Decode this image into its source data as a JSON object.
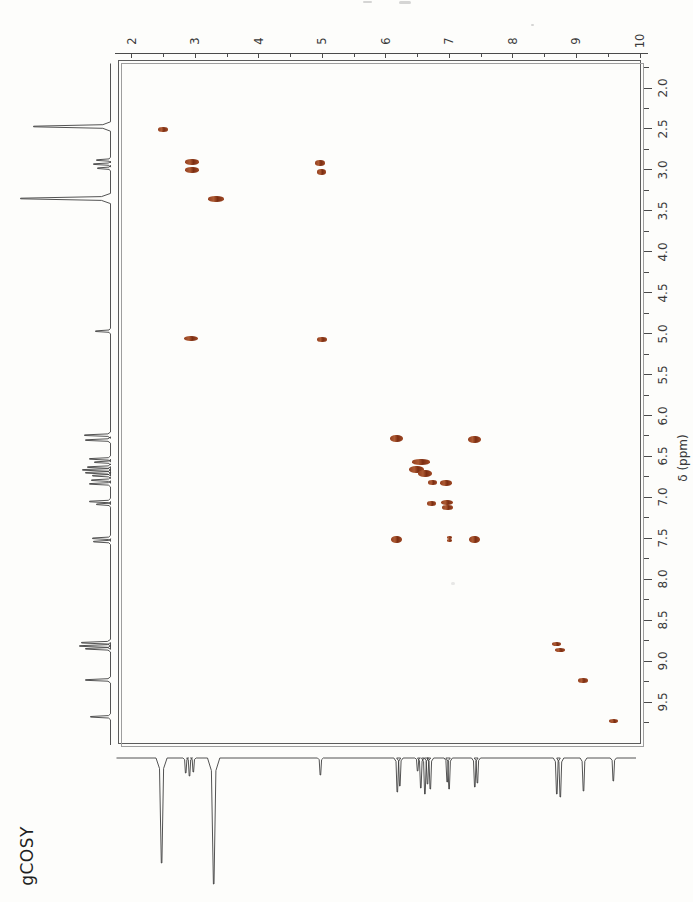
{
  "page": {
    "title_label": "gCOSY"
  },
  "axes": {
    "f1": {
      "tick_labels": [
        "2",
        "3",
        "4",
        "5",
        "6",
        "7",
        "8",
        "9",
        "10"
      ],
      "range_ppm": [
        1.8,
        10.0
      ],
      "minor_tick_step": 0.5
    },
    "f2": {
      "title": "δ (ppm)",
      "tick_labels": [
        "2.0",
        "2.5",
        "3.0",
        "3.5",
        "4.0",
        "4.5",
        "5.0",
        "5.5",
        "6.0",
        "6.5",
        "7.0",
        "7.5",
        "8.0",
        "8.5",
        "9.0",
        "9.5"
      ],
      "range_ppm": [
        1.65,
        10.0
      ],
      "minor_tick_step": 0.25
    }
  },
  "chart_data": {
    "type": "scatter",
    "subtype": "2D NMR COSY contour map with 1D projection traces",
    "title": "gCOSY",
    "x_axis": {
      "range": [
        2,
        10
      ],
      "ticks_every": 1,
      "minor_ticks_every": 0.5
    },
    "y_axis": {
      "label": "δ (ppm)",
      "range": [
        2.0,
        9.5
      ],
      "ticks_every": 0.5,
      "minor_ticks_every": 0.25
    },
    "diagonal_shifts_ppm": [
      2.5,
      2.95,
      3.35,
      5.0,
      6.2,
      6.55,
      6.7,
      7.0,
      7.45,
      8.7,
      9.15,
      9.6
    ],
    "correlations_ppm": [
      [
        2.95,
        5.0
      ],
      [
        6.2,
        7.45
      ],
      [
        6.75,
        6.85
      ],
      [
        6.95,
        6.85
      ],
      [
        6.7,
        7.05
      ],
      [
        7.0,
        7.5
      ]
    ],
    "blobs": [
      {
        "f1": 2.5,
        "f2": 2.51,
        "w_px": 10,
        "h_px": 5,
        "kind": "diagonal"
      },
      {
        "f1": 2.955,
        "f2": 2.9,
        "w_px": 14,
        "h_px": 6,
        "kind": "diagonal"
      },
      {
        "f1": 2.945,
        "f2": 3.0,
        "w_px": 14,
        "h_px": 6,
        "kind": "diagonal"
      },
      {
        "f1": 4.965,
        "f2": 2.92,
        "w_px": 10,
        "h_px": 6,
        "kind": "cross"
      },
      {
        "f1": 4.99,
        "f2": 3.02,
        "w_px": 9,
        "h_px": 6,
        "kind": "cross"
      },
      {
        "f1": 3.33,
        "f2": 3.36,
        "w_px": 16,
        "h_px": 6,
        "kind": "diagonal"
      },
      {
        "f1": 2.93,
        "f2": 5.06,
        "w_px": 14,
        "h_px": 5,
        "kind": "cross"
      },
      {
        "f1": 4.99,
        "f2": 5.07,
        "w_px": 10,
        "h_px": 5,
        "kind": "diagonal"
      },
      {
        "f1": 6.17,
        "f2": 6.28,
        "w_px": 13,
        "h_px": 7,
        "kind": "diagonal"
      },
      {
        "f1": 7.4,
        "f2": 6.29,
        "w_px": 13,
        "h_px": 7,
        "kind": "cross"
      },
      {
        "f1": 6.56,
        "f2": 6.57,
        "w_px": 18,
        "h_px": 6,
        "kind": "diagonal"
      },
      {
        "f1": 6.48,
        "f2": 6.665,
        "w_px": 15,
        "h_px": 7,
        "kind": "diagonal"
      },
      {
        "f1": 6.62,
        "f2": 6.71,
        "w_px": 14,
        "h_px": 7,
        "kind": "diagonal"
      },
      {
        "f1": 6.74,
        "f2": 6.82,
        "w_px": 9,
        "h_px": 5,
        "kind": "cross"
      },
      {
        "f1": 6.95,
        "f2": 6.82,
        "w_px": 12,
        "h_px": 6,
        "kind": "cross"
      },
      {
        "f1": 6.72,
        "f2": 7.07,
        "w_px": 9,
        "h_px": 5,
        "kind": "cross"
      },
      {
        "f1": 6.97,
        "f2": 7.06,
        "w_px": 12,
        "h_px": 5,
        "kind": "diagonal"
      },
      {
        "f1": 6.97,
        "f2": 7.12,
        "w_px": 11,
        "h_px": 5,
        "kind": "diagonal"
      },
      {
        "f1": 6.17,
        "f2": 7.51,
        "w_px": 11,
        "h_px": 7,
        "kind": "cross"
      },
      {
        "f1": 7.0,
        "f2": 7.49,
        "w_px": 5,
        "h_px": 3,
        "kind": "cross"
      },
      {
        "f1": 7.0,
        "f2": 7.53,
        "w_px": 5,
        "h_px": 3,
        "kind": "cross"
      },
      {
        "f1": 7.4,
        "f2": 7.51,
        "w_px": 11,
        "h_px": 7,
        "kind": "diagonal"
      },
      {
        "f1": 8.685,
        "f2": 8.795,
        "w_px": 9,
        "h_px": 4,
        "kind": "diagonal"
      },
      {
        "f1": 8.745,
        "f2": 8.865,
        "w_px": 10,
        "h_px": 4,
        "kind": "diagonal"
      },
      {
        "f1": 9.11,
        "f2": 9.24,
        "w_px": 10,
        "h_px": 5,
        "kind": "diagonal"
      },
      {
        "f1": 9.58,
        "f2": 9.73,
        "w_px": 9,
        "h_px": 4,
        "kind": "diagonal"
      }
    ],
    "f2_projection_peaks": [
      {
        "ppm": 2.47,
        "amp_px": 77
      },
      {
        "ppm": 2.88,
        "amp_px": 14
      },
      {
        "ppm": 2.93,
        "amp_px": 17
      },
      {
        "ppm": 2.98,
        "amp_px": 13
      },
      {
        "ppm": 3.35,
        "amp_px": 90
      },
      {
        "ppm": 4.97,
        "amp_px": 15
      },
      {
        "ppm": 6.24,
        "amp_px": 26
      },
      {
        "ppm": 6.3,
        "amp_px": 25
      },
      {
        "ppm": 6.53,
        "amp_px": 21
      },
      {
        "ppm": 6.57,
        "amp_px": 16
      },
      {
        "ppm": 6.63,
        "amp_px": 23
      },
      {
        "ppm": 6.665,
        "amp_px": 28
      },
      {
        "ppm": 6.7,
        "amp_px": 25
      },
      {
        "ppm": 6.735,
        "amp_px": 18
      },
      {
        "ppm": 6.79,
        "amp_px": 19
      },
      {
        "ppm": 6.835,
        "amp_px": 21
      },
      {
        "ppm": 7.05,
        "amp_px": 21
      },
      {
        "ppm": 7.085,
        "amp_px": 14
      },
      {
        "ppm": 7.5,
        "amp_px": 18
      },
      {
        "ppm": 7.54,
        "amp_px": 17
      },
      {
        "ppm": 8.775,
        "amp_px": 29
      },
      {
        "ppm": 8.815,
        "amp_px": 31
      },
      {
        "ppm": 8.85,
        "amp_px": 25
      },
      {
        "ppm": 9.23,
        "amp_px": 25
      },
      {
        "ppm": 9.68,
        "amp_px": 20
      }
    ],
    "f1_projection_peaks": [
      {
        "ppm": 2.47,
        "amp_px": 105
      },
      {
        "ppm": 2.85,
        "amp_px": 15
      },
      {
        "ppm": 2.91,
        "amp_px": 18
      },
      {
        "ppm": 2.97,
        "amp_px": 14
      },
      {
        "ppm": 3.29,
        "amp_px": 126
      },
      {
        "ppm": 4.97,
        "amp_px": 17
      },
      {
        "ppm": 6.18,
        "amp_px": 34
      },
      {
        "ppm": 6.22,
        "amp_px": 28
      },
      {
        "ppm": 6.5,
        "amp_px": 13
      },
      {
        "ppm": 6.55,
        "amp_px": 30
      },
      {
        "ppm": 6.615,
        "amp_px": 36
      },
      {
        "ppm": 6.655,
        "amp_px": 26
      },
      {
        "ppm": 6.7,
        "amp_px": 31
      },
      {
        "ppm": 6.965,
        "amp_px": 24
      },
      {
        "ppm": 6.995,
        "amp_px": 31
      },
      {
        "ppm": 7.4,
        "amp_px": 29
      },
      {
        "ppm": 7.44,
        "amp_px": 25
      },
      {
        "ppm": 8.69,
        "amp_px": 36
      },
      {
        "ppm": 8.745,
        "amp_px": 39
      },
      {
        "ppm": 9.11,
        "amp_px": 33
      },
      {
        "ppm": 9.58,
        "amp_px": 23
      }
    ]
  }
}
